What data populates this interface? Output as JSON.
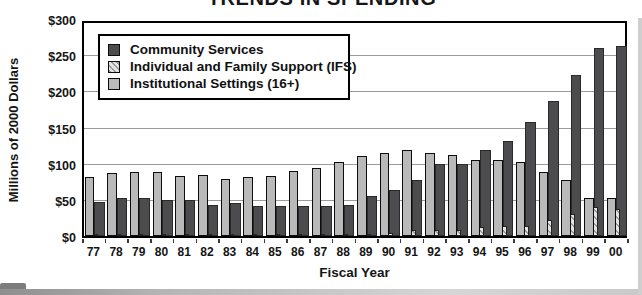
{
  "chart_data": {
    "type": "bar",
    "title": "TRENDS IN SPENDING",
    "xlabel": "Fiscal Year",
    "ylabel": "Millions of 2000 Dollars",
    "ylim": [
      0,
      300
    ],
    "ytick_step": 50,
    "ytick_labels": [
      "$0",
      "$50",
      "$100",
      "$150",
      "$200",
      "$250",
      "$300"
    ],
    "grid": true,
    "legend_position": "upper-left",
    "categories": [
      "77",
      "78",
      "79",
      "80",
      "81",
      "82",
      "83",
      "84",
      "85",
      "86",
      "87",
      "88",
      "89",
      "90",
      "91",
      "92",
      "93",
      "94",
      "95",
      "96",
      "97",
      "98",
      "99",
      "00"
    ],
    "series": [
      {
        "name": "Community Services",
        "style": "dark",
        "color": "#4c4c4e",
        "values": [
          47,
          52,
          53,
          50,
          50,
          43,
          45,
          42,
          42,
          41,
          42,
          43,
          55,
          64,
          78,
          100,
          99,
          119,
          132,
          158,
          187,
          222,
          260,
          263
        ]
      },
      {
        "name": "Individual and Family Support (IFS)",
        "style": "hatch",
        "color": "#e3e3e3",
        "hatch_color": "#9a9a9a",
        "values": [
          1,
          1,
          1,
          1,
          1,
          1,
          1,
          1,
          1,
          2,
          2,
          2,
          3,
          4,
          8,
          8,
          8,
          12,
          14,
          14,
          22,
          31,
          40,
          37
        ]
      },
      {
        "name": "Institutional Settings (16+)",
        "style": "gray",
        "color": "#b9b9b9",
        "values": [
          82,
          87,
          89,
          88,
          83,
          84,
          79,
          82,
          83,
          90,
          94,
          103,
          110,
          115,
          119,
          115,
          112,
          105,
          105,
          102,
          89,
          77,
          53,
          52
        ]
      }
    ]
  }
}
